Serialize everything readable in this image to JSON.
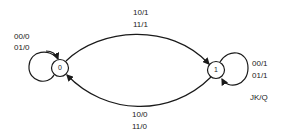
{
  "diagram": {
    "type": "state-diagram",
    "states": [
      {
        "id": "0",
        "label": "0"
      },
      {
        "id": "1",
        "label": "1"
      }
    ],
    "transitions": [
      {
        "from": "0",
        "to": "0",
        "labels": [
          "00/0",
          "01/0"
        ]
      },
      {
        "from": "0",
        "to": "1",
        "labels": [
          "10/1",
          "11/1"
        ]
      },
      {
        "from": "1",
        "to": "0",
        "labels": [
          "10/0",
          "11/0"
        ]
      },
      {
        "from": "1",
        "to": "1",
        "labels": [
          "00/1",
          "01/1"
        ]
      }
    ],
    "legend": "JK/Q",
    "colors": {
      "stroke": "#1a1a1a",
      "background": "#ffffff"
    }
  }
}
